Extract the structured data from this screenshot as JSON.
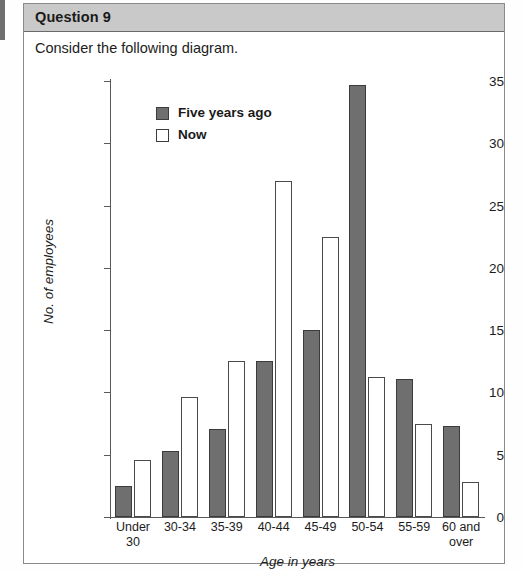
{
  "question": {
    "header_label": "Question 9",
    "prompt": "Consider the following diagram."
  },
  "colors": {
    "header_band": "#c9c9c9",
    "bar_five_years_ago": "#706f6f",
    "bar_now": "#ffffff",
    "axis": "#5a5a5a",
    "card_border": "#8a8a8a"
  },
  "chart_data": {
    "type": "bar",
    "title": "",
    "xlabel": "Age in years",
    "ylabel": "No. of employees",
    "ylim": [
      0,
      35
    ],
    "yticks": [
      0,
      5,
      10,
      15,
      20,
      25,
      30,
      35
    ],
    "grid": false,
    "legend_position": "top-left-inside",
    "categories": [
      "Under 30",
      "30-34",
      "35-39",
      "40-44",
      "45-49",
      "50-54",
      "55-59",
      "60 and over"
    ],
    "category_lines": [
      [
        "Under",
        "30"
      ],
      [
        "30-34"
      ],
      [
        "35-39"
      ],
      [
        "40-44"
      ],
      [
        "45-49"
      ],
      [
        "50-54"
      ],
      [
        "55-59"
      ],
      [
        "60 and",
        "over"
      ]
    ],
    "series": [
      {
        "name": "Five years ago",
        "values": [
          2.5,
          5.3,
          7.1,
          12.5,
          15.0,
          34.7,
          11.1,
          7.3
        ]
      },
      {
        "name": "Now",
        "values": [
          4.6,
          9.6,
          12.5,
          27.0,
          22.5,
          11.2,
          7.5,
          2.8
        ]
      }
    ]
  }
}
